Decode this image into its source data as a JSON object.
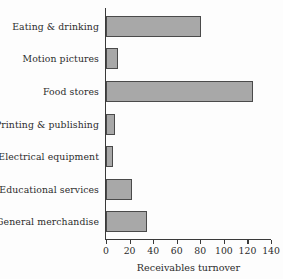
{
  "chart_data": {
    "type": "bar",
    "orientation": "horizontal",
    "title": "",
    "xlabel": "Receivables turnover",
    "ylabel": "",
    "categories": [
      "Eating & drinking",
      "Motion pictures",
      "Food stores",
      "Printing & publishing",
      "Electrical equipment",
      "Educational services",
      "General merchandise"
    ],
    "values": [
      81,
      10,
      125,
      8,
      6,
      22,
      35
    ],
    "xlim": [
      0,
      140
    ],
    "xticks": [
      0,
      20,
      40,
      60,
      80,
      100,
      120,
      140
    ],
    "xtick_labels": [
      "0",
      "20",
      "40",
      "60",
      "80",
      "100",
      "120",
      "140"
    ],
    "grid": false,
    "legend": null,
    "bar_fill_color": "#a8a8a8",
    "bar_edge_color": "#4a4a4a",
    "axis_color": "#3a3a3a",
    "background_color": "#fdfdfd",
    "text_color": "#2b2b2b"
  }
}
